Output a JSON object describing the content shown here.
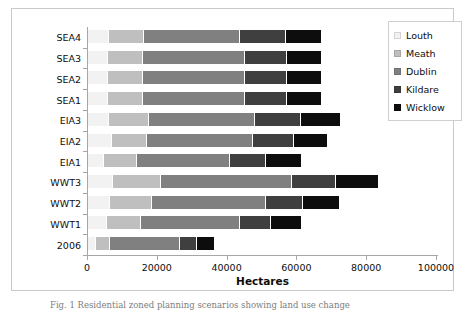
{
  "chart_data": {
    "type": "bar",
    "orientation": "horizontal",
    "stacked": true,
    "title": "",
    "xlabel": "Hectares",
    "ylabel": "",
    "xlim": [
      0,
      100000
    ],
    "xticks": [
      0,
      20000,
      40000,
      60000,
      80000,
      100000
    ],
    "xtick_labels": [
      "0",
      "20000",
      "40000",
      "60000",
      "80000",
      "100000"
    ],
    "grid": false,
    "legend_position": "top-right",
    "categories": [
      "2006",
      "WWT1",
      "WWT2",
      "WWT3",
      "EIA1",
      "EIA2",
      "EIA3",
      "SEA1",
      "SEA2",
      "SEA3",
      "SEA4"
    ],
    "categories_top_to_bottom": [
      "SEA4",
      "SEA3",
      "SEA2",
      "SEA1",
      "EIA3",
      "EIA2",
      "EIA1",
      "WWT3",
      "WWT2",
      "WWT1",
      "2006"
    ],
    "series": [
      {
        "name": "Louth",
        "color": "#f2f2f2",
        "values": [
          2300,
          5400,
          6300,
          7200,
          4600,
          6900,
          6000,
          5700,
          5700,
          5700,
          6000
        ]
      },
      {
        "name": "Meath",
        "color": "#bfbfbf",
        "values": [
          4000,
          9700,
          12000,
          13800,
          9500,
          10000,
          11500,
          10000,
          10000,
          10000,
          10000
        ]
      },
      {
        "name": "Dublin",
        "color": "#808080",
        "values": [
          20000,
          28400,
          32700,
          37500,
          26600,
          30400,
          30400,
          29200,
          29200,
          29200,
          27500
        ]
      },
      {
        "name": "Kildare",
        "color": "#3f3f3f",
        "values": [
          4900,
          8900,
          10600,
          12600,
          10300,
          11700,
          13200,
          12000,
          12000,
          12000,
          13200
        ]
      },
      {
        "name": "Wicklow",
        "color": "#0d0d0d",
        "values": [
          4900,
          8600,
          10300,
          12000,
          10000,
          9500,
          11200,
          10000,
          10000,
          10000,
          10000
        ]
      }
    ],
    "totals": [
      36100,
      61000,
      71900,
      83100,
      61000,
      68500,
      72300,
      66900,
      66900,
      66900,
      66700
    ]
  },
  "legend": {
    "items": [
      {
        "label": "Louth",
        "color": "#f2f2f2"
      },
      {
        "label": "Meath",
        "color": "#bfbfbf"
      },
      {
        "label": "Dublin",
        "color": "#808080"
      },
      {
        "label": "Kildare",
        "color": "#3f3f3f"
      },
      {
        "label": "Wicklow",
        "color": "#0d0d0d"
      }
    ]
  },
  "axis": {
    "x_title": "Hectares"
  },
  "caption": {
    "text": "Fig. 1 Residential zoned planning scenarios showing  land use change"
  }
}
